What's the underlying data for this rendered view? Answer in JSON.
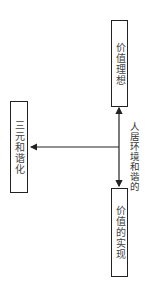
{
  "diagram": {
    "orientation": "rotated 90deg clockwise",
    "nodes": {
      "top": "价值理想",
      "bottom": "价值的实现",
      "left": "三元和谐化"
    },
    "center_label": [
      "和谐的",
      "人居环境"
    ],
    "edges": [
      {
        "from": "center",
        "to": "价值理想",
        "type": "arrow"
      },
      {
        "from": "center",
        "to": "价值的实现",
        "type": "arrow"
      },
      {
        "from": "center",
        "to": "三元和谐化",
        "type": "arrow"
      }
    ],
    "colors": {
      "line": "#222222",
      "text": "#444444"
    }
  }
}
